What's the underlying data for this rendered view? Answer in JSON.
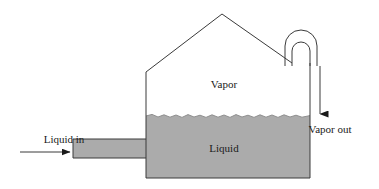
{
  "diagram": {
    "labels": {
      "vapor": "Vapor",
      "liquid": "Liquid",
      "liquid_in": "Liquid in",
      "vapor_out": "Vapor out"
    },
    "colors": {
      "liquid_fill": "#ababab",
      "outline": "#3a3a3a",
      "background": "#ffffff",
      "text": "#1a1a1a"
    },
    "geometry": {
      "vessel_left_x": 146,
      "vessel_right_x": 310,
      "vessel_bottom_y": 178,
      "wall_top_y": 72,
      "roof_apex_x": 222,
      "roof_apex_y": 14,
      "liquid_level_y": 116,
      "inlet_pipe_left_x": 73,
      "inlet_pipe_top_y": 139,
      "inlet_pipe_bottom_y": 158,
      "outlet_pipe_outer_left_x": 285,
      "outlet_pipe_outer_right_x": 317,
      "outlet_pipe_inner_left_x": 292,
      "outlet_pipe_inner_right_x": 310,
      "outlet_arch_top_y": 30,
      "inlet_arrow_y": 152,
      "inlet_arrow_x_start": 20,
      "inlet_arrow_x_end": 73,
      "outlet_arrow_x": 320,
      "outlet_arrow_y_start": 66,
      "outlet_arrow_y_end": 118
    },
    "label_positions": {
      "vapor": {
        "x": 224,
        "y": 88
      },
      "liquid": {
        "x": 224,
        "y": 152
      },
      "liquid_in": {
        "x": 64,
        "y": 143
      },
      "vapor_out": {
        "x": 330,
        "y": 133
      }
    },
    "icons": {
      "inlet_flow_arrow": "arrow-right-icon",
      "outlet_flow_arrow": "arrow-down-icon"
    }
  }
}
